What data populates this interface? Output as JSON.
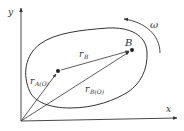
{
  "diagram": {
    "type": "rigid-body-kinematics",
    "axes": {
      "x_label": "x",
      "y_label": "y"
    },
    "points": [
      {
        "id": "A",
        "label": "",
        "x": 58,
        "y": 71
      },
      {
        "id": "B",
        "label": "B",
        "x": 132,
        "y": 50
      }
    ],
    "vectors": [
      {
        "from": "O",
        "to": "A",
        "label": "r",
        "subscript": "A(O)"
      },
      {
        "from": "O",
        "to": "B",
        "label": "r",
        "subscript": "B(O)"
      },
      {
        "from": "A",
        "to": "B",
        "label": "r",
        "subscript": "B"
      }
    ],
    "rotation": {
      "label": "ω",
      "direction": "counterclockwise"
    },
    "colors": {
      "stroke": "#333333",
      "background": "#ffffff"
    }
  }
}
